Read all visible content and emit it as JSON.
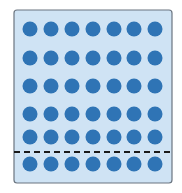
{
  "diagram": {
    "colors": {
      "box_fill": "#cfe3f4",
      "box_stroke": "#6b7580",
      "dot": "#2f74b5",
      "dashed_line": "#1a1a1a"
    },
    "box": {
      "x": 14,
      "y": 10,
      "width": 158,
      "height": 173,
      "rx": 3
    },
    "rows": 6,
    "columns": 7,
    "column_centers": [
      30,
      51,
      72,
      93,
      114,
      134,
      155
    ],
    "row_centers": [
      29,
      58,
      86,
      114,
      137,
      164
    ],
    "dot_radius": 7.5,
    "divider": {
      "y": 152,
      "x1": 14,
      "x2": 172,
      "style": "dashed"
    }
  }
}
